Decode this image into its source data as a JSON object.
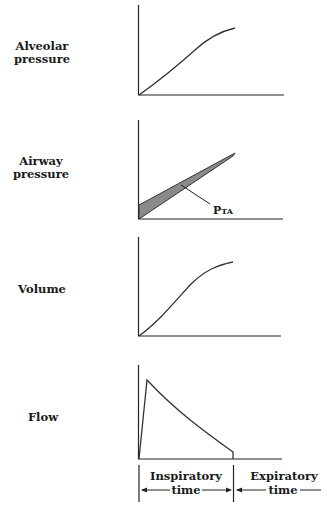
{
  "panels": [
    {
      "label_lines": [
        "Alveolar",
        "pressure"
      ],
      "curve": "sigmoid-rise"
    },
    {
      "label_lines": [
        "Airway",
        "pressure"
      ],
      "curve": "linear-rise-with-shaded-band",
      "annotation": "PTA"
    },
    {
      "label_lines": [
        "Volume"
      ],
      "curve": "sigmoid-rise"
    },
    {
      "label_lines": [
        "Flow"
      ],
      "curve": "rapid-peak-then-decay"
    }
  ],
  "annotation": {
    "main": "P",
    "sub": "TA"
  },
  "time_axis": {
    "inspiratory": {
      "line1": "Inspiratory",
      "line2": "time"
    },
    "expiratory": {
      "line1": "Expiratory",
      "line2": "time"
    }
  },
  "colors": {
    "ink": "#222222",
    "shade": "#8a8a8a",
    "background": "#ffffff"
  }
}
